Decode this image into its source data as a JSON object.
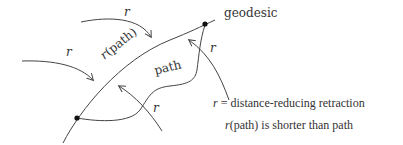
{
  "labels": {
    "geodesic": "geodesic",
    "r_path": "r(path)",
    "path": "path",
    "r": "r"
  },
  "legend": {
    "line1_symbol": "r",
    "line1_rest": " = distance-reducing retraction",
    "line2_symbol": "r",
    "line2_rest": "(path) is shorter than path"
  },
  "colors": {
    "stroke": "#444444",
    "text": "#333333",
    "dot": "#111111",
    "background": "#ffffff"
  }
}
